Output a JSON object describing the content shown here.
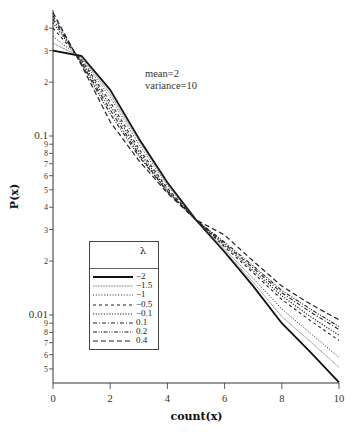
{
  "chart_data": {
    "type": "line",
    "title": "",
    "xlabel": "count(x)",
    "ylabel": "P(x)",
    "yscale": "log",
    "xlim": [
      0,
      10
    ],
    "ylim": [
      0.0042,
      0.506
    ],
    "grid": false,
    "legend_position": "lower-left inside plot",
    "legend_title": "λ",
    "annotations": [
      "mean=2",
      "variance=10"
    ],
    "xticks": [
      {
        "value": 0,
        "label": "0"
      },
      {
        "value": 2,
        "label": "2"
      },
      {
        "value": 4,
        "label": "4"
      },
      {
        "value": 6,
        "label": "6"
      },
      {
        "value": 8,
        "label": "8"
      },
      {
        "value": 10,
        "label": "10"
      }
    ],
    "yticks": [
      {
        "value": 0.4,
        "label": "4"
      },
      {
        "value": 0.3,
        "label": "3"
      },
      {
        "value": 0.2,
        "label": "2"
      },
      {
        "value": 0.1,
        "label": "0.1",
        "major": true
      },
      {
        "value": 0.09,
        "label": "9"
      },
      {
        "value": 0.08,
        "label": "8"
      },
      {
        "value": 0.07,
        "label": "7"
      },
      {
        "value": 0.06,
        "label": "6"
      },
      {
        "value": 0.05,
        "label": "5"
      },
      {
        "value": 0.04,
        "label": "4"
      },
      {
        "value": 0.03,
        "label": "3"
      },
      {
        "value": 0.02,
        "label": "2"
      },
      {
        "value": 0.01,
        "label": "0.01",
        "major": true
      },
      {
        "value": 0.009,
        "label": "9"
      },
      {
        "value": 0.008,
        "label": "8"
      },
      {
        "value": 0.007,
        "label": "7"
      },
      {
        "value": 0.006,
        "label": "6"
      },
      {
        "value": 0.005,
        "label": "5"
      }
    ],
    "x": [
      0,
      1,
      2,
      3,
      4,
      5,
      6,
      7,
      8,
      9,
      10
    ],
    "series": [
      {
        "name": "−2",
        "style": "solid-thick",
        "values": [
          0.3,
          0.28,
          0.181,
          0.097,
          0.055,
          0.034,
          0.0225,
          0.0145,
          0.009,
          0.0062,
          0.0042
        ]
      },
      {
        "name": "−1.5",
        "style": "dense-dotted",
        "values": [
          0.33,
          0.275,
          0.172,
          0.094,
          0.054,
          0.034,
          0.0228,
          0.0152,
          0.0098,
          0.0071,
          0.0051
        ]
      },
      {
        "name": "−1",
        "style": "dotted",
        "values": [
          0.36,
          0.27,
          0.165,
          0.09,
          0.053,
          0.034,
          0.0233,
          0.016,
          0.0108,
          0.0079,
          0.0058
        ]
      },
      {
        "name": "−0.5",
        "style": "dashed",
        "values": [
          0.4,
          0.265,
          0.155,
          0.085,
          0.051,
          0.034,
          0.024,
          0.0172,
          0.0122,
          0.0093,
          0.0072
        ]
      },
      {
        "name": "−0.1",
        "style": "dotted-bold",
        "values": [
          0.43,
          0.26,
          0.148,
          0.082,
          0.05,
          0.034,
          0.0245,
          0.0177,
          0.0128,
          0.0098,
          0.0077
        ]
      },
      {
        "name": "0.1",
        "style": "dash-dot",
        "values": [
          0.45,
          0.255,
          0.14,
          0.079,
          0.049,
          0.034,
          0.025,
          0.0183,
          0.0133,
          0.0104,
          0.0083
        ]
      },
      {
        "name": "0.2",
        "style": "dash-dot-dot",
        "values": [
          0.47,
          0.252,
          0.133,
          0.077,
          0.049,
          0.034,
          0.0255,
          0.0188,
          0.0137,
          0.0108,
          0.0086
        ]
      },
      {
        "name": "0.4",
        "style": "long-dash",
        "values": [
          0.49,
          0.248,
          0.12,
          0.073,
          0.048,
          0.034,
          0.028,
          0.02,
          0.0145,
          0.0115,
          0.0094
        ]
      }
    ]
  },
  "styles": {
    "solid-thick": {
      "width": 1.8,
      "dash": "",
      "color": "#111111"
    },
    "dense-dotted": {
      "width": 0.8,
      "dash": "1,0.6",
      "color": "#555555"
    },
    "dotted": {
      "width": 1.0,
      "dash": "1,1.8",
      "color": "#222222"
    },
    "dashed": {
      "width": 1.1,
      "dash": "3,3",
      "color": "#222222"
    },
    "dotted-bold": {
      "width": 1.2,
      "dash": "1.2,1.5",
      "color": "#222222"
    },
    "dash-dot": {
      "width": 1.1,
      "dash": "4,2,1,2",
      "color": "#222222"
    },
    "dash-dot-dot": {
      "width": 1.1,
      "dash": "4,1.5,1,1.5,1,1.5",
      "color": "#222222"
    },
    "long-dash": {
      "width": 1.2,
      "dash": "5,3",
      "color": "#222222"
    }
  }
}
